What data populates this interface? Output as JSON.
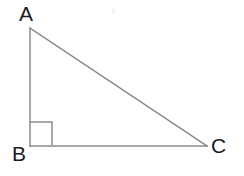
{
  "figure": {
    "kind": "right-triangle-diagram",
    "canvas": {
      "width": 244,
      "height": 176,
      "background": "#ffffff"
    },
    "stroke": {
      "color": "#8a8a8a",
      "width": 1.5
    },
    "label_color": "#1c1c1c",
    "label_font_size_px": 21,
    "vertices": [
      {
        "id": "A",
        "label": "A",
        "x": 30,
        "y": 28,
        "label_x": 19,
        "label_y": 3
      },
      {
        "id": "B",
        "label": "B",
        "x": 30,
        "y": 146,
        "label_x": 12,
        "label_y": 143
      },
      {
        "id": "C",
        "label": "C",
        "x": 207,
        "y": 146,
        "label_x": 211,
        "label_y": 135
      }
    ],
    "edges": [
      {
        "id": "AB",
        "name": "leg-vertical",
        "from": "A",
        "to": "B",
        "x1": 30,
        "y1": 28,
        "x2": 30,
        "y2": 146
      },
      {
        "id": "BC",
        "name": "leg-horizontal",
        "from": "B",
        "to": "C",
        "x1": 30,
        "y1": 146,
        "x2": 207,
        "y2": 146
      },
      {
        "id": "AC",
        "name": "hypotenuse",
        "from": "A",
        "to": "C",
        "x1": 30,
        "y1": 28,
        "x2": 207,
        "y2": 146
      }
    ],
    "right_angle_marker": {
      "at_vertex": "B",
      "size": 23,
      "path": "M 30 122 L 52 122 L 52 145"
    },
    "artifact": {
      "x": 112,
      "y": 9,
      "width": 3,
      "height": 4,
      "color": "#f4f4f4"
    }
  }
}
